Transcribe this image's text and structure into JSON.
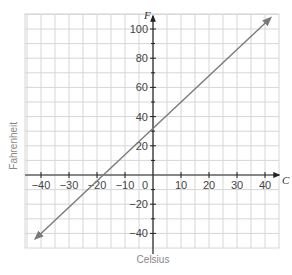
{
  "chart_data": {
    "type": "line",
    "title": "",
    "xlabel": "Celsius",
    "ylabel": "Fahrenheit",
    "x_axis_name": "C",
    "y_axis_name": "F",
    "xlim": [
      -45,
      45
    ],
    "ylim": [
      -50,
      110
    ],
    "x_ticks": [
      -40,
      -30,
      -20,
      -10,
      0,
      10,
      20,
      30,
      40
    ],
    "y_ticks": [
      -40,
      -20,
      20,
      40,
      60,
      80,
      100
    ],
    "grid": true,
    "x_grid_step": 5,
    "y_grid_step": 10,
    "series": [
      {
        "name": "F = 1.8C + 32",
        "x": [
          -42,
          -40,
          -20,
          0,
          20,
          40,
          42
        ],
        "values": [
          -43.6,
          -40,
          -4,
          32,
          68,
          104,
          107.6
        ],
        "color": "#7a7a7a",
        "arrows_both_ends": true
      }
    ]
  },
  "labels": {
    "xlabel": "Celsius",
    "ylabel": "Fahrenheit",
    "x_axis_name": "C",
    "y_axis_name": "F"
  }
}
